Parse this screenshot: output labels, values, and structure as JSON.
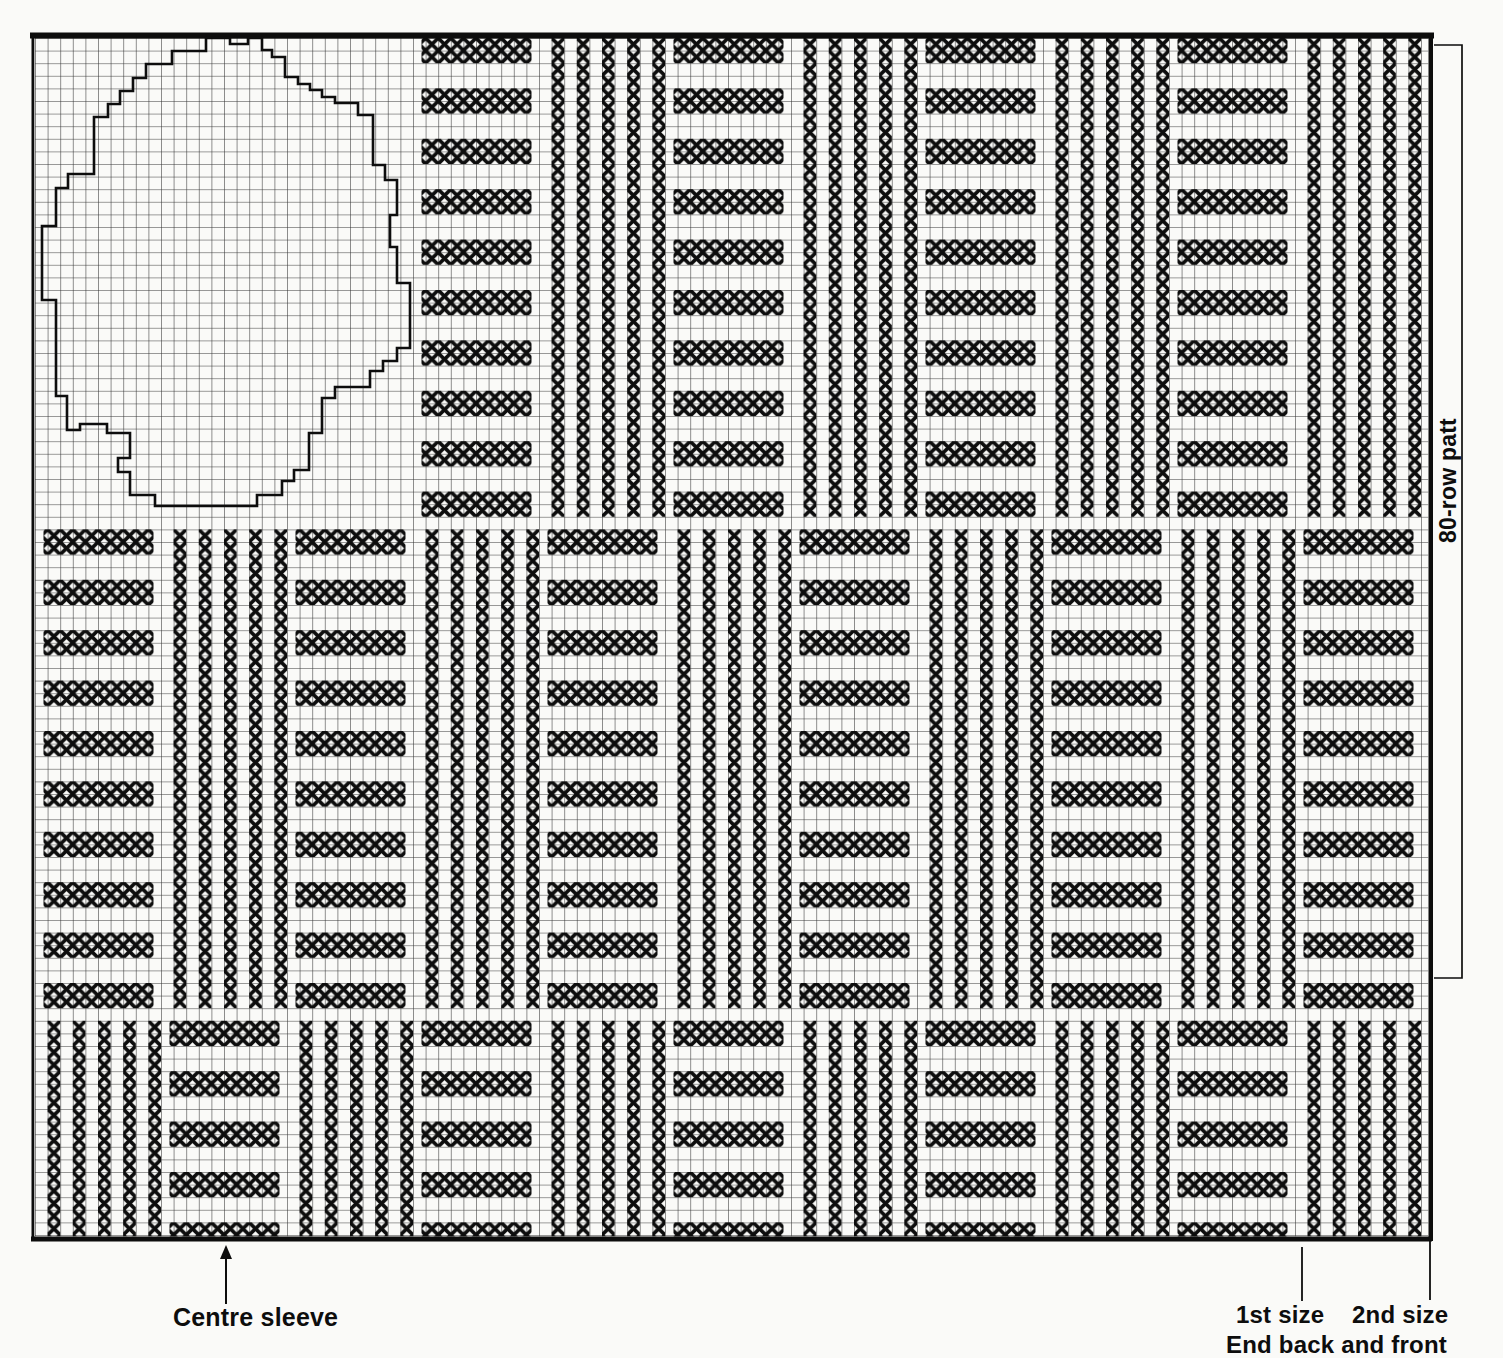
{
  "page": {
    "width": 1503,
    "height": 1358,
    "background": "#fafaf8",
    "ink": "#0d0d0d",
    "grid_line_color": "#343434"
  },
  "labels": {
    "centre_sleeve": "Centre sleeve",
    "first_size": "1st size",
    "second_size": "2nd size",
    "end_back_and_front": "End back and front",
    "row_patt": "80-row patt"
  },
  "chart": {
    "x0": 35,
    "y0": 38,
    "cell": 12.6,
    "block_w": 126,
    "n_blocks": 11,
    "right_edge": 1428.5,
    "bottom_edge": 1236.5,
    "grid_stroke": 1.1,
    "x_stroke": 3.6,
    "bands": [
      {
        "y": 38,
        "n_bars": 10,
        "content_rows": 38,
        "h_blocks": [
          3,
          5,
          7,
          9
        ],
        "v_blocks": [
          4,
          6,
          8,
          10
        ]
      },
      {
        "y": 529.4,
        "n_bars": 10,
        "content_rows": 38,
        "h_blocks": [
          0,
          2,
          4,
          6,
          8,
          10
        ],
        "v_blocks": [
          1,
          3,
          5,
          7,
          9
        ]
      },
      {
        "y": 1020.8,
        "n_bars": 5,
        "content_rows": 38,
        "h_blocks": [
          1,
          3,
          5,
          7,
          9
        ],
        "v_blocks": [
          0,
          2,
          4,
          6,
          8,
          10
        ]
      }
    ],
    "bar": {
      "inset": 8.5,
      "width": 110,
      "height": 25.2,
      "period": 50.4
    },
    "v_col_cells": [
      1,
      3,
      5,
      7,
      9
    ],
    "borders": {
      "top": {
        "x": 30,
        "y": 32.5,
        "w": 1404,
        "h": 6
      },
      "bottom": {
        "x": 31,
        "y": 1236.5,
        "w": 1401,
        "h": 5
      },
      "left": {
        "x": 31.5,
        "y": 33,
        "w": 2.8,
        "h": 1208
      },
      "right": {
        "x": 1428.5,
        "y": 33,
        "w": 4.5,
        "h": 1208
      }
    },
    "sleeve_outline": [
      [
        206,
        38
      ],
      [
        206,
        51
      ],
      [
        172,
        51
      ],
      [
        172,
        64
      ],
      [
        146,
        64
      ],
      [
        146,
        78
      ],
      [
        133,
        78
      ],
      [
        133,
        91
      ],
      [
        120,
        91
      ],
      [
        120,
        104
      ],
      [
        108,
        104
      ],
      [
        108,
        117
      ],
      [
        94,
        117
      ],
      [
        94,
        174
      ],
      [
        68,
        174
      ],
      [
        68,
        188
      ],
      [
        56,
        188
      ],
      [
        56,
        226
      ],
      [
        42,
        226
      ],
      [
        42,
        300
      ],
      [
        56,
        300
      ],
      [
        56,
        396
      ],
      [
        67,
        396
      ],
      [
        67,
        430
      ],
      [
        80,
        430
      ],
      [
        80,
        424
      ],
      [
        107,
        424
      ],
      [
        107,
        433
      ],
      [
        130,
        433
      ],
      [
        130,
        458
      ],
      [
        118,
        458
      ],
      [
        118,
        472
      ],
      [
        130,
        472
      ],
      [
        130,
        495
      ],
      [
        155,
        495
      ],
      [
        155,
        506
      ],
      [
        257,
        506
      ],
      [
        257,
        495
      ],
      [
        282,
        495
      ],
      [
        282,
        481
      ],
      [
        294,
        481
      ],
      [
        294,
        470
      ],
      [
        309,
        470
      ],
      [
        309,
        433
      ],
      [
        322,
        433
      ],
      [
        322,
        398
      ],
      [
        335,
        398
      ],
      [
        335,
        387
      ],
      [
        370,
        387
      ],
      [
        370,
        371
      ],
      [
        383,
        371
      ],
      [
        383,
        361
      ],
      [
        397,
        361
      ],
      [
        397,
        348
      ],
      [
        410,
        348
      ],
      [
        410,
        283
      ],
      [
        397,
        283
      ],
      [
        397,
        247
      ],
      [
        390,
        247
      ],
      [
        390,
        215
      ],
      [
        397,
        215
      ],
      [
        397,
        180
      ],
      [
        385,
        180
      ],
      [
        385,
        165
      ],
      [
        373,
        165
      ],
      [
        373,
        115
      ],
      [
        358,
        115
      ],
      [
        358,
        103
      ],
      [
        335,
        103
      ],
      [
        335,
        97
      ],
      [
        322,
        97
      ],
      [
        322,
        90
      ],
      [
        310,
        90
      ],
      [
        310,
        84
      ],
      [
        298,
        84
      ],
      [
        298,
        77
      ],
      [
        285,
        77
      ],
      [
        285,
        57
      ],
      [
        272,
        57
      ],
      [
        272,
        50
      ],
      [
        262,
        50
      ],
      [
        262,
        38
      ],
      [
        248,
        38
      ],
      [
        248,
        44
      ],
      [
        230,
        44
      ],
      [
        230,
        38
      ]
    ],
    "sleeve_stroke": 2.6,
    "bracket": {
      "x": 1462,
      "top": 45,
      "bottom": 978,
      "tick_x": 1434,
      "stroke": 1.7
    },
    "arrow": {
      "x": 226,
      "tip_y": 1245,
      "tail_y": 1304,
      "head_w": 12,
      "head_l": 14,
      "stroke": 2
    },
    "size_ticks": [
      {
        "x": 1302,
        "y1": 1247,
        "y2": 1301
      },
      {
        "x": 1430,
        "y1": 1241,
        "y2": 1300
      }
    ]
  }
}
